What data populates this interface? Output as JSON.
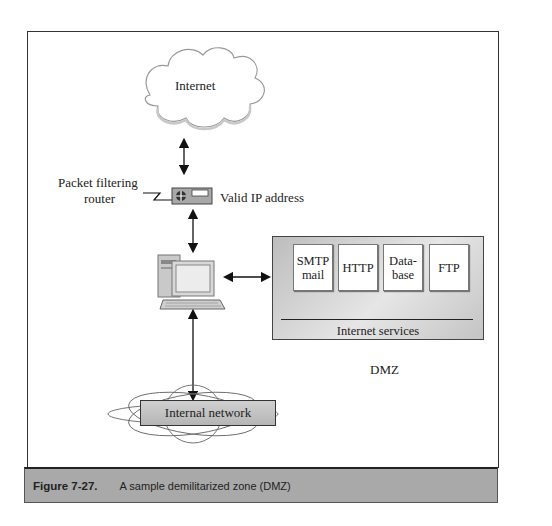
{
  "diagram": {
    "nodes": {
      "internet": {
        "label": "Internet"
      },
      "router": {
        "label_line1": "Packet filtering",
        "label_line2": "router",
        "address_label": "Valid IP address"
      },
      "computer": {
        "label": ""
      },
      "dmz": {
        "services": [
          {
            "label_line1": "SMTP",
            "label_line2": "mail"
          },
          {
            "label_line1": "HTTP",
            "label_line2": ""
          },
          {
            "label_line1": "Data-",
            "label_line2": "base"
          },
          {
            "label_line1": "FTP",
            "label_line2": ""
          }
        ],
        "services_group_label": "Internet services",
        "zone_label": "DMZ"
      },
      "internal_network": {
        "label": "Internal network"
      }
    },
    "edges": [
      {
        "from": "internet",
        "to": "router",
        "type": "bidirectional"
      },
      {
        "from": "router",
        "to": "computer",
        "type": "bidirectional"
      },
      {
        "from": "computer",
        "to": "dmz",
        "type": "bidirectional"
      },
      {
        "from": "computer",
        "to": "internal_network",
        "type": "bidirectional"
      }
    ]
  },
  "caption": {
    "number": "Figure 7-27.",
    "text": "A sample demilitarized zone (DMZ)"
  },
  "colors": {
    "caption_band": "#a9a9a9",
    "dmz_box": "#cfcfcf",
    "frame_border": "#333333"
  }
}
